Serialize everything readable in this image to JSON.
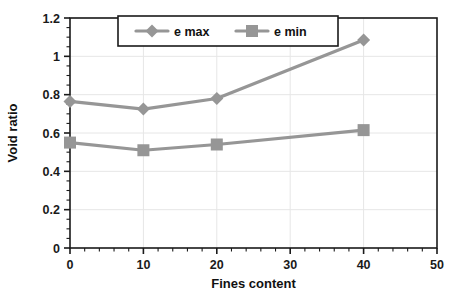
{
  "chart_data": {
    "type": "line",
    "title": "",
    "xlabel": "Fines content",
    "ylabel": "Void ratio",
    "xlim": [
      0,
      50
    ],
    "ylim": [
      0,
      1.2
    ],
    "x_ticks": [
      "0",
      "10",
      "20",
      "30",
      "40",
      "50"
    ],
    "x_tick_values": [
      0,
      10,
      20,
      30,
      40,
      50
    ],
    "x_minor_step": 2,
    "y_ticks": [
      "0",
      "0.2",
      "0.4",
      "0.6",
      "0.8",
      "1",
      "1.2"
    ],
    "y_tick_values": [
      0,
      0.2,
      0.4,
      0.6,
      0.8,
      1,
      1.2
    ],
    "y_minor_step": 0.05,
    "grid": true,
    "legend_position": "top-center",
    "x": [
      0,
      10,
      20,
      40
    ],
    "series": [
      {
        "name": "e max",
        "marker": "diamond",
        "color": "#969696",
        "values": [
          0.765,
          0.725,
          0.78,
          1.085
        ]
      },
      {
        "name": "e min",
        "marker": "square",
        "color": "#969696",
        "values": [
          0.55,
          0.51,
          0.54,
          0.615
        ]
      }
    ]
  },
  "colors": {
    "series": "#969696",
    "axis": "#1a1a1a",
    "grid": "#e6e6e6",
    "legend_border": "#1a1a1a",
    "background": "#ffffff"
  }
}
